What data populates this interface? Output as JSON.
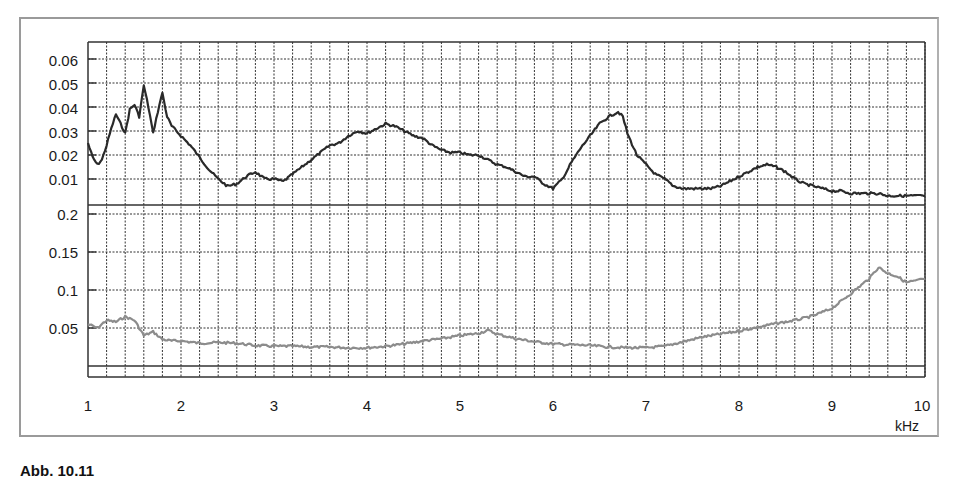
{
  "figure": {
    "caption": "Abb. 10.11",
    "x_unit": "kHz"
  },
  "colors": {
    "upper_series": "#2a2a2a",
    "lower_series": "#8c8c8c",
    "grid": "#333333",
    "frame": "#9a9a9a"
  },
  "chart_data": [
    {
      "type": "line",
      "title": "",
      "xlabel": "kHz",
      "ylabel": "",
      "xlim": [
        1,
        10
      ],
      "ylim": [
        0,
        0.065
      ],
      "x_ticks": [
        "1",
        "2",
        "3",
        "4",
        "5",
        "6",
        "7",
        "8",
        "9",
        "10"
      ],
      "y_ticks": [
        "0.06",
        "0.05",
        "0.04",
        "0.03",
        "0.02",
        "0.01"
      ],
      "grid": true,
      "minor_x_grid_step": 0.2,
      "series": [
        {
          "name": "upper",
          "x": [
            1.0,
            1.05,
            1.1,
            1.15,
            1.2,
            1.25,
            1.3,
            1.35,
            1.4,
            1.45,
            1.5,
            1.55,
            1.6,
            1.65,
            1.7,
            1.75,
            1.8,
            1.85,
            1.9,
            2.0,
            2.1,
            2.2,
            2.3,
            2.4,
            2.5,
            2.6,
            2.7,
            2.8,
            2.9,
            3.0,
            3.1,
            3.2,
            3.3,
            3.4,
            3.5,
            3.6,
            3.7,
            3.8,
            3.9,
            4.0,
            4.1,
            4.2,
            4.3,
            4.4,
            4.5,
            4.6,
            4.7,
            4.8,
            4.9,
            5.0,
            5.1,
            5.2,
            5.3,
            5.4,
            5.5,
            5.6,
            5.7,
            5.8,
            5.9,
            6.0,
            6.1,
            6.2,
            6.3,
            6.4,
            6.5,
            6.6,
            6.7,
            6.75,
            6.8,
            6.9,
            7.0,
            7.1,
            7.2,
            7.3,
            7.4,
            7.5,
            7.6,
            7.7,
            7.8,
            7.9,
            8.0,
            8.1,
            8.2,
            8.3,
            8.4,
            8.5,
            8.6,
            8.7,
            8.8,
            8.9,
            9.0,
            9.1,
            9.2,
            9.3,
            9.4,
            9.5,
            9.6,
            9.7,
            9.8,
            9.9,
            10.0
          ],
          "values": [
            0.025,
            0.019,
            0.016,
            0.018,
            0.024,
            0.031,
            0.037,
            0.033,
            0.029,
            0.039,
            0.041,
            0.036,
            0.049,
            0.04,
            0.029,
            0.038,
            0.046,
            0.036,
            0.032,
            0.028,
            0.024,
            0.019,
            0.014,
            0.01,
            0.007,
            0.008,
            0.011,
            0.013,
            0.01,
            0.01,
            0.009,
            0.012,
            0.015,
            0.018,
            0.021,
            0.024,
            0.025,
            0.028,
            0.03,
            0.029,
            0.031,
            0.033,
            0.032,
            0.03,
            0.028,
            0.027,
            0.024,
            0.022,
            0.021,
            0.021,
            0.02,
            0.02,
            0.018,
            0.016,
            0.015,
            0.013,
            0.011,
            0.011,
            0.008,
            0.006,
            0.01,
            0.017,
            0.023,
            0.028,
            0.033,
            0.036,
            0.038,
            0.036,
            0.029,
            0.02,
            0.016,
            0.012,
            0.01,
            0.007,
            0.006,
            0.006,
            0.006,
            0.006,
            0.007,
            0.009,
            0.011,
            0.013,
            0.015,
            0.016,
            0.015,
            0.013,
            0.01,
            0.008,
            0.007,
            0.006,
            0.005,
            0.005,
            0.004,
            0.004,
            0.004,
            0.004,
            0.003,
            0.003,
            0.003,
            0.003,
            0.003
          ]
        }
      ]
    },
    {
      "type": "line",
      "title": "",
      "xlabel": "kHz",
      "ylabel": "",
      "xlim": [
        1,
        10
      ],
      "ylim": [
        0,
        0.21
      ],
      "x_ticks": [
        "1",
        "2",
        "3",
        "4",
        "5",
        "6",
        "7",
        "8",
        "9",
        "10"
      ],
      "y_ticks": [
        "0.2",
        "0.15",
        "0.1",
        "0.05"
      ],
      "grid": true,
      "minor_x_grid_step": 0.2,
      "series": [
        {
          "name": "lower",
          "x": [
            1.0,
            1.1,
            1.2,
            1.3,
            1.4,
            1.5,
            1.6,
            1.7,
            1.8,
            1.9,
            2.0,
            2.2,
            2.4,
            2.6,
            2.8,
            3.0,
            3.2,
            3.4,
            3.6,
            3.8,
            4.0,
            4.2,
            4.4,
            4.6,
            4.8,
            5.0,
            5.2,
            5.3,
            5.4,
            5.6,
            5.8,
            6.0,
            6.2,
            6.4,
            6.6,
            6.8,
            7.0,
            7.2,
            7.4,
            7.6,
            7.8,
            8.0,
            8.2,
            8.4,
            8.6,
            8.8,
            9.0,
            9.2,
            9.4,
            9.5,
            9.6,
            9.7,
            9.8,
            9.9,
            10.0
          ],
          "values": [
            0.055,
            0.05,
            0.06,
            0.058,
            0.065,
            0.06,
            0.04,
            0.045,
            0.035,
            0.033,
            0.033,
            0.03,
            0.031,
            0.03,
            0.027,
            0.026,
            0.026,
            0.025,
            0.025,
            0.024,
            0.024,
            0.026,
            0.029,
            0.033,
            0.036,
            0.04,
            0.043,
            0.047,
            0.042,
            0.036,
            0.032,
            0.029,
            0.028,
            0.027,
            0.025,
            0.024,
            0.024,
            0.026,
            0.032,
            0.038,
            0.042,
            0.046,
            0.051,
            0.056,
            0.06,
            0.066,
            0.076,
            0.095,
            0.115,
            0.13,
            0.122,
            0.118,
            0.11,
            0.112,
            0.115
          ]
        }
      ]
    }
  ]
}
